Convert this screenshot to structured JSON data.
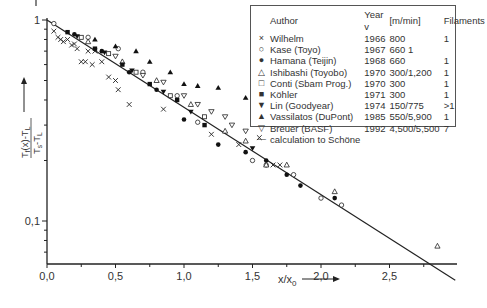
{
  "chart_data": {
    "type": "scatter",
    "title": "",
    "xlabel": "x/x0",
    "ylabel": "(T_f(x) - T_L) / (T_s - T_L)",
    "xscale": "linear",
    "yscale": "log",
    "xlim": [
      0.0,
      3.0
    ],
    "ylim": [
      0.061,
      1.0
    ],
    "x_ticks": [
      "0,0",
      "0,5",
      "1,0",
      "1,5",
      "2,0",
      "2,5"
    ],
    "y_ticks": [
      "1",
      "0,1"
    ],
    "grid": false,
    "legend_position": "upper right",
    "legend_columns": [
      "Author",
      "Year",
      "v [m/min]",
      "Filaments"
    ],
    "series": [
      {
        "name": "Wilhelm",
        "marker": "x",
        "year": "1966",
        "v": "800",
        "filaments": "1",
        "points": [
          [
            0.05,
            0.88
          ],
          [
            0.08,
            0.82
          ],
          [
            0.1,
            0.8
          ],
          [
            0.12,
            0.78
          ],
          [
            0.15,
            0.8
          ],
          [
            0.18,
            0.75
          ],
          [
            0.2,
            0.76
          ],
          [
            0.22,
            0.72
          ],
          [
            0.25,
            0.62
          ],
          [
            0.28,
            0.62
          ],
          [
            0.3,
            0.7
          ],
          [
            0.33,
            0.6
          ],
          [
            0.35,
            0.7
          ],
          [
            0.4,
            0.62
          ],
          [
            0.45,
            0.52
          ],
          [
            0.5,
            0.5
          ],
          [
            0.52,
            0.45
          ],
          [
            0.6,
            0.38
          ],
          [
            0.85,
            0.36
          ],
          [
            1.2,
            0.27
          ],
          [
            1.4,
            0.24
          ],
          [
            1.55,
            0.26
          ],
          [
            1.65,
            0.19
          ],
          [
            1.7,
            0.19
          ]
        ]
      },
      {
        "name": "Kase (Toyo)",
        "marker": "o",
        "year": "1967",
        "v": "660",
        "filaments": "1",
        "points": [
          [
            0.05,
            0.96
          ],
          [
            0.3,
            0.82
          ],
          [
            0.52,
            0.72
          ],
          [
            0.7,
            0.55
          ],
          [
            0.95,
            0.42
          ],
          [
            1.1,
            0.31
          ],
          [
            1.5,
            0.2
          ],
          [
            1.6,
            0.19
          ],
          [
            1.8,
            0.17
          ],
          [
            2.0,
            0.13
          ],
          [
            2.15,
            0.12
          ]
        ]
      },
      {
        "name": "Hamana (Teijin)",
        "marker": "filled-circle",
        "year": "1968",
        "v": "660",
        "filaments": "1",
        "points": [
          [
            0.2,
            0.85
          ],
          [
            0.4,
            0.7
          ],
          [
            0.6,
            0.55
          ],
          [
            0.8,
            0.45
          ],
          [
            1.0,
            0.32
          ],
          [
            1.25,
            0.24
          ],
          [
            1.45,
            0.22
          ],
          [
            1.6,
            0.2
          ],
          [
            1.75,
            0.17
          ],
          [
            1.85,
            0.15
          ],
          [
            2.1,
            0.13
          ]
        ]
      },
      {
        "name": "Ishibashi (Toyobo)",
        "marker": "open-triangle-up",
        "year": "1970",
        "v": "300/1,200",
        "filaments": "1",
        "points": [
          [
            0.3,
            0.78
          ],
          [
            0.55,
            0.62
          ],
          [
            0.8,
            0.5
          ],
          [
            1.05,
            0.38
          ],
          [
            1.3,
            0.28
          ],
          [
            1.45,
            0.25
          ],
          [
            1.6,
            0.19
          ],
          [
            1.75,
            0.19
          ],
          [
            2.1,
            0.14
          ],
          [
            2.85,
            0.075
          ]
        ]
      },
      {
        "name": "Conti (Sbam Prog.)",
        "marker": "open-square",
        "year": "1970",
        "v": "300",
        "filaments": "1",
        "points": [
          [
            0.25,
            0.82
          ],
          [
            0.45,
            0.68
          ],
          [
            0.65,
            0.55
          ],
          [
            0.9,
            0.42
          ],
          [
            1.15,
            0.33
          ]
        ]
      },
      {
        "name": "Köhler",
        "marker": "filled-square",
        "year": "1971",
        "v": "300",
        "filaments": "1",
        "points": [
          [
            0.15,
            0.87
          ],
          [
            0.35,
            0.72
          ],
          [
            0.55,
            0.6
          ],
          [
            0.75,
            0.48
          ],
          [
            0.95,
            0.4
          ],
          [
            1.15,
            0.3
          ]
        ]
      },
      {
        "name": "Lin (Goodyear)",
        "marker": "filled-triangle-down",
        "year": "1974",
        "v": "150/775",
        "filaments": ">1",
        "points": [
          [
            0.22,
            0.83
          ],
          [
            0.42,
            0.69
          ],
          [
            0.62,
            0.56
          ],
          [
            0.85,
            0.44
          ],
          [
            1.05,
            0.35
          ],
          [
            1.5,
            0.23
          ]
        ]
      },
      {
        "name": "Vassilatos (DuPont)",
        "marker": "filled-triangle-up",
        "year": "1985",
        "v": "550/5,900",
        "filaments": "1",
        "points": [
          [
            0.35,
            0.8
          ],
          [
            0.5,
            0.74
          ],
          [
            0.65,
            0.7
          ],
          [
            0.75,
            0.62
          ],
          [
            0.9,
            0.55
          ],
          [
            1.0,
            0.48
          ],
          [
            1.1,
            0.47
          ],
          [
            1.25,
            0.46
          ],
          [
            1.45,
            0.41
          ]
        ]
      },
      {
        "name": "Breuer (BASF)",
        "marker": "open-triangle-down",
        "year": "1992",
        "v": "4,500/5,500",
        "filaments": "7",
        "points": [
          [
            0.5,
            0.66
          ],
          [
            0.7,
            0.53
          ],
          [
            0.85,
            0.49
          ],
          [
            1.0,
            0.42
          ],
          [
            1.1,
            0.38
          ],
          [
            1.2,
            0.35
          ],
          [
            1.3,
            0.33
          ],
          [
            1.35,
            0.3
          ],
          [
            1.45,
            0.28
          ]
        ]
      },
      {
        "name": "calculation to Schöne",
        "marker": "line",
        "year": "",
        "v": "",
        "filaments": "",
        "function": "exp(-x/x0)",
        "points": [
          [
            0.0,
            1.0
          ],
          [
            3.0,
            0.0498
          ]
        ]
      }
    ]
  },
  "legend": {
    "header": {
      "author": "Author",
      "year": "Year v",
      "v": "[m/min]",
      "filaments": "Filaments"
    },
    "rows": [
      {
        "sym": "×",
        "author": "Wilhelm",
        "year": "1966",
        "v": "800",
        "filaments": "1"
      },
      {
        "sym": "○",
        "author": "Kase (Toyo)",
        "year": "1967",
        "v": "660  1",
        "filaments": ""
      },
      {
        "sym": "●",
        "author": "Hamana (Teijin)",
        "year": "1968",
        "v": "660",
        "filaments": "1"
      },
      {
        "sym": "△",
        "author": "Ishibashi (Toyobo)",
        "year": "1970",
        "v": "300/1,200",
        "filaments": "1"
      },
      {
        "sym": "□",
        "author": "Conti (Sbam Prog.)",
        "year": "1970",
        "v": "300",
        "filaments": "1"
      },
      {
        "sym": "■",
        "author": "Köhler",
        "year": "1971",
        "v": "300",
        "filaments": "1"
      },
      {
        "sym": "▼",
        "author": "Lin (Goodyear)",
        "year": "1974",
        "v": "150/775",
        "filaments": ">1"
      },
      {
        "sym": "▲",
        "author": "Vassilatos (DuPont)",
        "year": "1985",
        "v": "550/5,900",
        "filaments": "1"
      },
      {
        "sym": "▽",
        "author": "Breuer (BASF)",
        "year": "1992",
        "v": "4,500/5,500",
        "filaments": "7"
      },
      {
        "sym": "—",
        "author": "calculation to Schöne",
        "year": "",
        "v": "",
        "filaments": ""
      }
    ]
  },
  "axes": {
    "x_label": "x/x",
    "x_label_sub": "0",
    "y_one": "1",
    "y_tenth": "0,1"
  }
}
